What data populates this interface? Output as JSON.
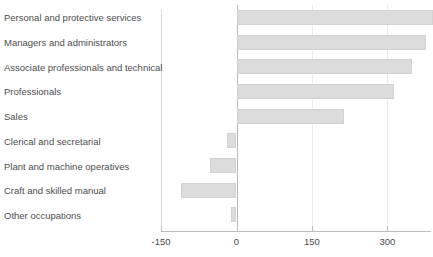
{
  "chart_data": {
    "type": "bar",
    "orientation": "horizontal",
    "title": "",
    "subtitle": "",
    "xlabel": "",
    "ylabel": "",
    "categories": [
      "Personal and protective services",
      "Managers and administrators",
      "Associate professionals and technical",
      "Professionals",
      "Sales",
      "Clerical and secretarial",
      "Plant and machine operatives",
      "Craft and skilled manual",
      "Other occupations"
    ],
    "values": [
      390,
      377,
      348,
      313,
      213,
      -19,
      -53,
      -110,
      -11
    ],
    "xlim": [
      -150,
      400
    ],
    "xticks": [
      -150,
      0,
      150,
      300
    ],
    "xtick_labels": [
      "-150",
      "0",
      "150",
      "300"
    ],
    "grid": "vertical-light",
    "legend": "none",
    "bar_color": "#dcdcdc",
    "zero_line_color": "#b9b9b9",
    "axis_color": "#bdbdbd",
    "text_color": "#4d4d4d"
  }
}
